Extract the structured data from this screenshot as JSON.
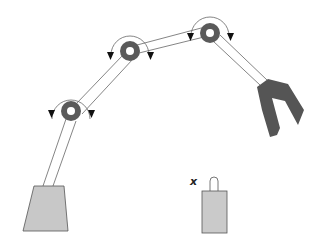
{
  "diagram": {
    "type": "robot-arm-illustration",
    "colors": {
      "background": "#ffffff",
      "link_stroke": "#555555",
      "joint_fill": "#5a5a5a",
      "joint_hole": "#ffffff",
      "gripper_fill": "#555555",
      "base_fill": "#c8c8c8",
      "base_stroke": "#555555",
      "object_fill": "#cacaca",
      "arrow_color": "#111111"
    },
    "object_label": "x",
    "components": {
      "base": "fixed base",
      "joints": [
        "joint-1",
        "joint-2",
        "joint-3"
      ],
      "links": [
        "link-base-to-joint1",
        "link-joint1-to-joint2",
        "link-joint2-to-joint3",
        "link-joint3-to-gripper"
      ],
      "end_effector": "gripper",
      "target": "object with handle"
    }
  }
}
